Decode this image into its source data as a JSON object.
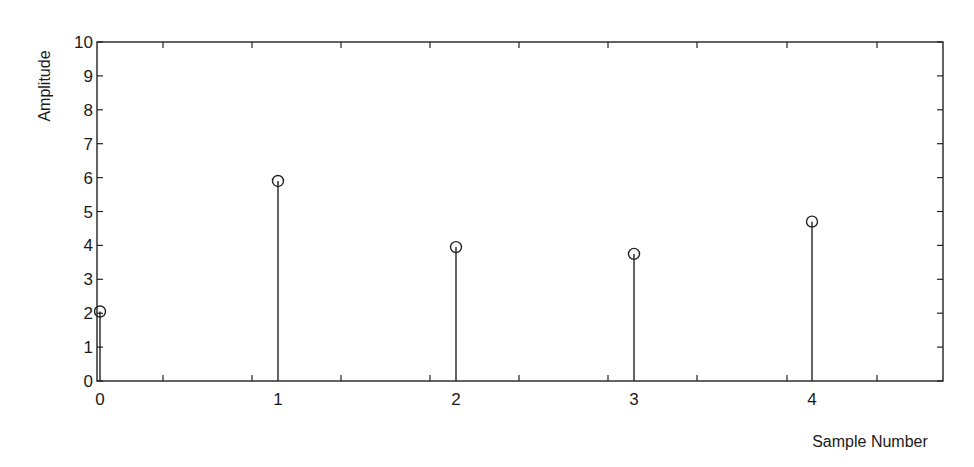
{
  "chart_data": {
    "type": "stem",
    "title": "",
    "xlabel": "Sample Number",
    "ylabel": "Amplitude",
    "x": [
      0,
      1,
      2,
      3,
      4
    ],
    "values": [
      2.05,
      5.9,
      3.95,
      3.75,
      4.7
    ],
    "xlim": [
      0,
      4.75
    ],
    "ylim": [
      0,
      10
    ],
    "x_tick_labels": [
      "0",
      "1",
      "2",
      "3",
      "4"
    ],
    "y_tick_labels": [
      "0",
      "1",
      "2",
      "3",
      "4",
      "5",
      "6",
      "7",
      "8",
      "9",
      "10"
    ],
    "minor_x_tick_pixels": [
      163,
      252,
      341,
      430,
      519,
      608,
      697,
      787,
      877
    ],
    "marker": "open-circle",
    "grid": false,
    "legend": null,
    "colors": {
      "line": "#222222",
      "background": "#ffffff"
    }
  },
  "layout": {
    "plot_left": 97,
    "plot_right": 943,
    "plot_top": 42,
    "plot_bottom": 381,
    "x0_px": 100,
    "x_unit_px": 178,
    "xlabel_x": 870,
    "xlabel_y": 447,
    "ylabel_x": 50,
    "ylabel_y": 86
  }
}
